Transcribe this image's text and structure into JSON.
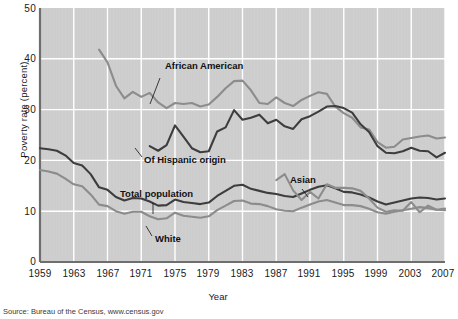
{
  "chart_data": {
    "type": "line",
    "title": "",
    "xlabel": "Year",
    "ylabel": "Poverty rate (percent)",
    "xlim": [
      1959,
      2007
    ],
    "ylim": [
      0,
      50
    ],
    "grid": true,
    "legend_position": "inline-annotations",
    "xticks": [
      "1959",
      "1963",
      "1967",
      "1971",
      "1975",
      "1979",
      "1983",
      "1987",
      "1991",
      "1995",
      "1999",
      "2003",
      "2007"
    ],
    "yticks": [
      "0",
      "10",
      "20",
      "30",
      "40",
      "50"
    ],
    "source": "Source: Bureau of the Census, www.census.gov",
    "series": [
      {
        "name": "African American",
        "color": "#8c8c8c",
        "label_x": 165,
        "label_y": 66,
        "leader": [
          [
            160,
            78
          ],
          [
            150,
            104
          ]
        ],
        "x": [
          1966,
          1967,
          1968,
          1969,
          1970,
          1971,
          1972,
          1973,
          1974,
          1975,
          1976,
          1977,
          1978,
          1979,
          1980,
          1981,
          1982,
          1983,
          1984,
          1985,
          1986,
          1987,
          1988,
          1989,
          1990,
          1991,
          1992,
          1993,
          1994,
          1995,
          1996,
          1997,
          1998,
          1999,
          2000,
          2001,
          2002,
          2003,
          2004,
          2005,
          2006,
          2007
        ],
        "y": [
          41.8,
          39.3,
          34.7,
          32.2,
          33.5,
          32.5,
          33.3,
          31.4,
          30.3,
          31.3,
          31.1,
          31.3,
          30.6,
          31.0,
          32.5,
          34.2,
          35.6,
          35.7,
          33.8,
          31.3,
          31.1,
          32.4,
          31.3,
          30.7,
          31.9,
          32.7,
          33.4,
          33.1,
          30.6,
          29.3,
          28.4,
          26.5,
          26.1,
          23.6,
          22.5,
          22.7,
          24.1,
          24.4,
          24.7,
          24.9,
          24.3,
          24.5
        ]
      },
      {
        "name": "Of Hispanic origin",
        "color": "#3d3d3d",
        "label_x": 144,
        "label_y": 159,
        "leader": [
          [
            142,
            157
          ],
          [
            135,
            148
          ]
        ],
        "x": [
          1972,
          1973,
          1974,
          1975,
          1976,
          1977,
          1978,
          1979,
          1980,
          1981,
          1982,
          1983,
          1984,
          1985,
          1986,
          1987,
          1988,
          1989,
          1990,
          1991,
          1992,
          1993,
          1994,
          1995,
          1996,
          1997,
          1998,
          1999,
          2000,
          2001,
          2002,
          2003,
          2004,
          2005,
          2006,
          2007
        ],
        "y": [
          22.8,
          21.9,
          23.0,
          26.9,
          24.7,
          22.4,
          21.6,
          21.8,
          25.7,
          26.5,
          29.9,
          28.0,
          28.4,
          29.0,
          27.3,
          28.0,
          26.7,
          26.2,
          28.1,
          28.7,
          29.6,
          30.6,
          30.7,
          30.3,
          29.4,
          27.1,
          25.6,
          22.8,
          21.5,
          21.4,
          21.8,
          22.5,
          21.9,
          21.8,
          20.6,
          21.5
        ]
      },
      {
        "name": "Total population",
        "color": "#3d3d3d",
        "label_x": 120,
        "label_y": 193,
        "leader": [
          [
            153,
            203
          ],
          [
            153,
            214
          ]
        ],
        "x": [
          1959,
          1960,
          1961,
          1962,
          1963,
          1964,
          1965,
          1966,
          1967,
          1968,
          1969,
          1970,
          1971,
          1972,
          1973,
          1974,
          1975,
          1976,
          1977,
          1978,
          1979,
          1980,
          1981,
          1982,
          1983,
          1984,
          1985,
          1986,
          1987,
          1988,
          1989,
          1990,
          1991,
          1992,
          1993,
          1994,
          1995,
          1996,
          1997,
          1998,
          1999,
          2000,
          2001,
          2002,
          2003,
          2004,
          2005,
          2006,
          2007
        ],
        "y": [
          22.4,
          22.2,
          21.9,
          21.0,
          19.5,
          19.0,
          17.3,
          14.7,
          14.2,
          12.8,
          12.1,
          12.6,
          12.5,
          11.9,
          11.1,
          11.2,
          12.3,
          11.8,
          11.6,
          11.4,
          11.7,
          13.0,
          14.0,
          15.0,
          15.2,
          14.4,
          14.0,
          13.6,
          13.4,
          13.0,
          12.8,
          13.5,
          14.2,
          14.8,
          15.1,
          14.5,
          13.8,
          13.7,
          13.3,
          12.7,
          11.9,
          11.3,
          11.7,
          12.1,
          12.5,
          12.7,
          12.6,
          12.3,
          12.5
        ]
      },
      {
        "name": "White",
        "color": "#8c8c8c",
        "label_x": 155,
        "label_y": 238,
        "leader": [
          [
            152,
            236
          ],
          [
            146,
            226
          ]
        ],
        "x": [
          1959,
          1960,
          1961,
          1962,
          1963,
          1964,
          1965,
          1966,
          1967,
          1968,
          1969,
          1970,
          1971,
          1972,
          1973,
          1974,
          1975,
          1976,
          1977,
          1978,
          1979,
          1980,
          1981,
          1982,
          1983,
          1984,
          1985,
          1986,
          1987,
          1988,
          1989,
          1990,
          1991,
          1992,
          1993,
          1994,
          1995,
          1996,
          1997,
          1998,
          1999,
          2000,
          2001,
          2002,
          2003,
          2004,
          2005,
          2006,
          2007
        ],
        "y": [
          18.1,
          17.8,
          17.4,
          16.4,
          15.3,
          14.9,
          13.3,
          11.3,
          11.0,
          10.0,
          9.5,
          9.9,
          9.9,
          9.0,
          8.4,
          8.6,
          9.7,
          9.1,
          8.9,
          8.7,
          9.0,
          10.2,
          11.1,
          12.0,
          12.1,
          11.5,
          11.4,
          11.0,
          10.4,
          10.1,
          10.0,
          10.7,
          11.3,
          11.9,
          12.2,
          11.7,
          11.2,
          11.2,
          11.0,
          10.5,
          9.8,
          9.5,
          9.9,
          10.2,
          10.5,
          10.8,
          10.6,
          10.3,
          10.5
        ]
      },
      {
        "name": "Asian",
        "color": "#8c8c8c",
        "label_x": 290,
        "label_y": 180,
        "leader": [
          [
            302,
            189
          ],
          [
            308,
            197
          ]
        ],
        "x": [
          1987,
          1988,
          1989,
          1990,
          1991,
          1992,
          1993,
          1994,
          1995,
          1996,
          1997,
          1998,
          1999,
          2000,
          2001,
          2002,
          2003,
          2004,
          2005,
          2006,
          2007
        ],
        "y": [
          16.1,
          17.3,
          14.1,
          12.2,
          13.8,
          12.5,
          15.3,
          14.6,
          14.6,
          14.5,
          14.0,
          12.5,
          10.7,
          9.9,
          10.2,
          10.1,
          11.8,
          9.8,
          11.1,
          10.3,
          10.2
        ]
      }
    ]
  }
}
